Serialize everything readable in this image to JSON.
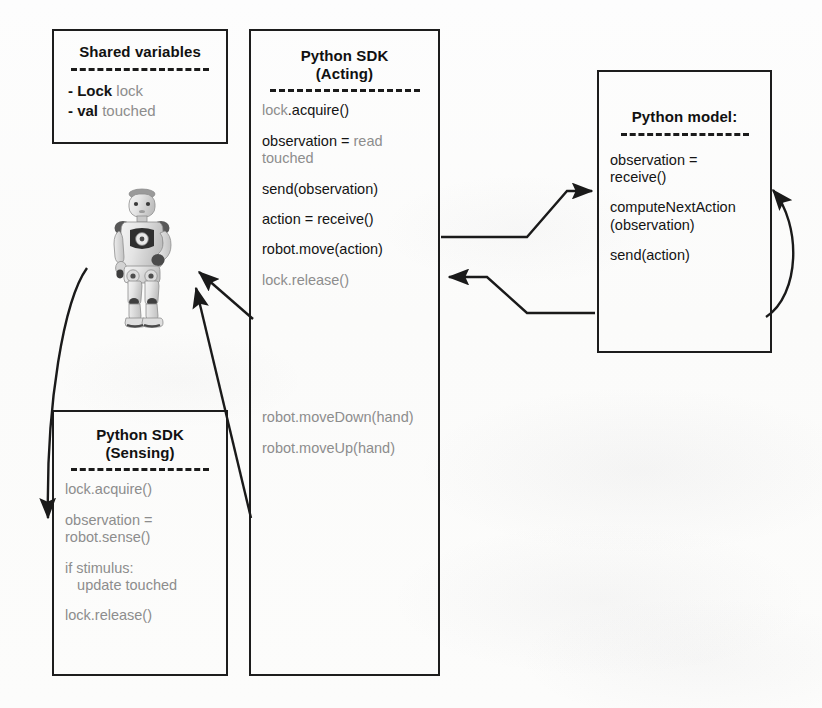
{
  "diagram": {
    "background_color": "#fdfdfc",
    "ink_color": "#141414",
    "faded_ink_color": "#8d8d8d"
  },
  "shared_variables_box": {
    "title": "Shared variables",
    "entries": [
      {
        "type": "- Lock",
        "name": "lock"
      },
      {
        "type": "- val",
        "name": "touched"
      }
    ]
  },
  "acting_box": {
    "title_line1": "Python SDK",
    "title_line2": "(Acting)",
    "lines": [
      {
        "faded": "lock",
        "dark": ".acquire()"
      },
      {
        "dark": "observation = ",
        "faded": "read touched"
      },
      {
        "dark": "send(observation)"
      },
      {
        "dark": "action = receive()"
      },
      {
        "dark": "robot.move(action)"
      },
      {
        "faded": "lock.release()"
      }
    ],
    "lower_lines": [
      {
        "faded": "robot.moveDown(hand)"
      },
      {
        "faded": "robot.moveUp(hand)"
      }
    ]
  },
  "model_box": {
    "title": "Python  model:",
    "lines": [
      "observation =\nreceive()",
      "computeNextAction\n(observation)",
      "send(action)"
    ]
  },
  "sensing_box": {
    "title_line1": "Python SDK",
    "title_line2": "(Sensing)",
    "lines": [
      "lock.acquire()",
      "observation =\nrobot.sense()",
      "if stimulus:\n   update touched",
      "lock.release()"
    ]
  },
  "robot": {
    "label": "NAO humanoid robot photograph"
  },
  "connectors": [
    {
      "name": "acting-send-observation-to-model",
      "from": "acting_box.send(observation)",
      "to": "model_box.observation = receive()"
    },
    {
      "name": "model-send-action-to-acting",
      "from": "model_box.send(action)",
      "to": "acting_box.action = receive()"
    },
    {
      "name": "model-self-loop",
      "from": "model_box.send(action)",
      "to": "model_box.observation = receive()"
    },
    {
      "name": "acting-move-to-robot",
      "from": "acting_box.robot.move(action)",
      "to": "robot"
    },
    {
      "name": "acting-movedown-to-robot",
      "from": "acting_box.robot.moveDown(hand)",
      "to": "robot"
    },
    {
      "name": "robot-to-sensing",
      "from": "robot",
      "to": "sensing_box.observation = robot.sense()"
    }
  ]
}
